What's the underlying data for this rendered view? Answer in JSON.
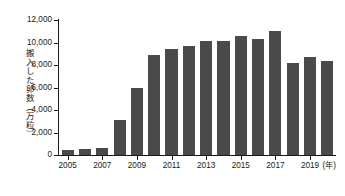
{
  "chart_data": {
    "type": "bar",
    "title": "",
    "subtitle": "",
    "xlabel": "(年)",
    "ylabel": "搬入した卵数（万粒）",
    "categories": [
      "2005",
      "2006",
      "2007",
      "2008",
      "2009",
      "2010",
      "2011",
      "2012",
      "2013",
      "2014",
      "2015",
      "2016",
      "2017",
      "2018",
      "2019",
      "2020"
    ],
    "values": [
      450,
      500,
      580,
      3100,
      5950,
      8850,
      9400,
      9700,
      10150,
      10100,
      10600,
      10300,
      11050,
      8200,
      8700,
      8350
    ],
    "series": [
      {
        "name": "搬入した卵数",
        "values": [
          450,
          500,
          580,
          3100,
          5950,
          8850,
          9400,
          9700,
          10150,
          10100,
          10600,
          10300,
          11050,
          8200,
          8700,
          8350
        ]
      }
    ],
    "ylim": [
      0,
      12000
    ],
    "y_ticks": [
      0,
      2000,
      4000,
      6000,
      8000,
      10000,
      12000
    ],
    "y_tick_labels": [
      "0",
      "2,000",
      "4,000",
      "6,000",
      "8,000",
      "10,000",
      "12,000"
    ],
    "x_tick_labels": [
      "2005",
      "2007",
      "2009",
      "2011",
      "2013",
      "2015",
      "2017",
      "2019",
      "(年)"
    ],
    "x_tick_categories": [
      "2005",
      "2007",
      "2009",
      "2011",
      "2013",
      "2015",
      "2017",
      "2019"
    ],
    "grid": false,
    "legend": null,
    "bar_color": "#4a4a4a",
    "axis_color": "#1a1a1a",
    "background": "#ffffff"
  },
  "axes": {
    "y_title": "搬入した卵数（万粒）",
    "x_unit_label": "(年)"
  }
}
